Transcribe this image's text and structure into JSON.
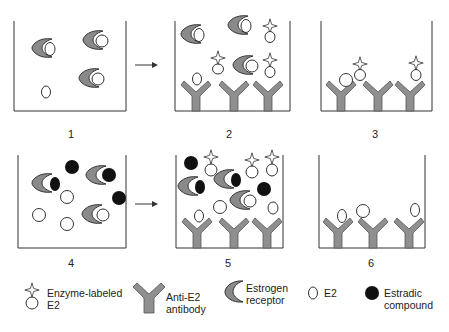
{
  "colors": {
    "line": "#333333",
    "receptor_fill": "#8a8a8a",
    "antibody_fill": "#8f8f8f",
    "compound_fill": "#111111",
    "background": "#ffffff"
  },
  "panels": [
    {
      "number": "1",
      "description": "Estrogen receptors bound to E2 and free E2 in solution"
    },
    {
      "number": "2",
      "description": "Addition of enzyme-labeled E2 to anti-E2 antibody-coated well"
    },
    {
      "number": "3",
      "description": "Enzyme-labeled E2 and E2 bound to anti-E2 antibodies"
    },
    {
      "number": "4",
      "description": "Estradic compounds compete with E2 for estrogen receptor binding"
    },
    {
      "number": "5",
      "description": "Addition of enzyme-labeled E2 to anti-E2 antibody-coated well"
    },
    {
      "number": "6",
      "description": "E2 bound to anti-E2 antibodies"
    }
  ],
  "arrows": [
    {
      "from": "1",
      "to": "2"
    },
    {
      "from": "4",
      "to": "5"
    }
  ],
  "legend": {
    "enzyme_labeled_e2": {
      "line1": "Enzyme-labeled",
      "line2": "E2",
      "icon": "enzyme-labeled-e2-icon"
    },
    "anti_e2_antibody": {
      "line1": "Anti-E2",
      "line2": "antibody",
      "icon": "antibody-icon"
    },
    "estrogen_receptor": {
      "line1": "Estrogen",
      "line2": "receptor",
      "icon": "crescent-receptor-icon"
    },
    "e2": {
      "line1": "E2",
      "icon": "oval-e2-icon"
    },
    "estradic_compound": {
      "line1": "Estradic",
      "line2": "compound",
      "icon": "filled-circle-icon"
    }
  }
}
